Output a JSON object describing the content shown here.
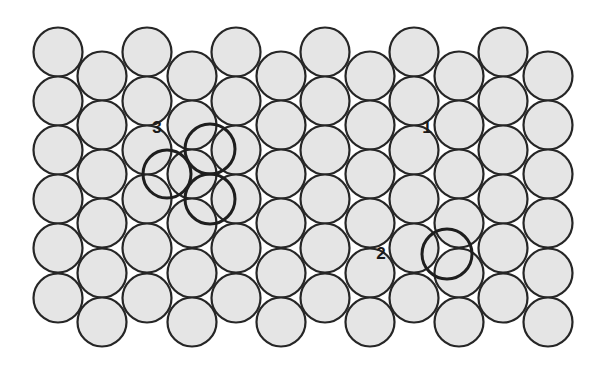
{
  "diagram": {
    "type": "close-packed circle layer with interstitial sites",
    "grid": {
      "columns_x": [
        58,
        102,
        147,
        192,
        236,
        281,
        325,
        370,
        414,
        459,
        503,
        548
      ],
      "high_rows_y": [
        52,
        101,
        150,
        199,
        248,
        298
      ],
      "low_rows_y": [
        76,
        125,
        174,
        223,
        273,
        322
      ],
      "radius": 24.5,
      "fill": "#e5e5e5",
      "stroke": "#262626"
    },
    "highlighted_sites": [
      {
        "group": "3",
        "cx": 167,
        "cy": 174,
        "r": 24
      },
      {
        "group": "3",
        "cx": 210,
        "cy": 149,
        "r": 25
      },
      {
        "group": "3",
        "cx": 210,
        "cy": 199,
        "r": 25
      },
      {
        "group": "2",
        "cx": 447,
        "cy": 254,
        "r": 25
      }
    ],
    "labels": [
      {
        "text": "1",
        "x": 427,
        "y": 133
      },
      {
        "text": "2",
        "x": 381,
        "y": 259
      },
      {
        "text": "3",
        "x": 157,
        "y": 133
      }
    ]
  }
}
